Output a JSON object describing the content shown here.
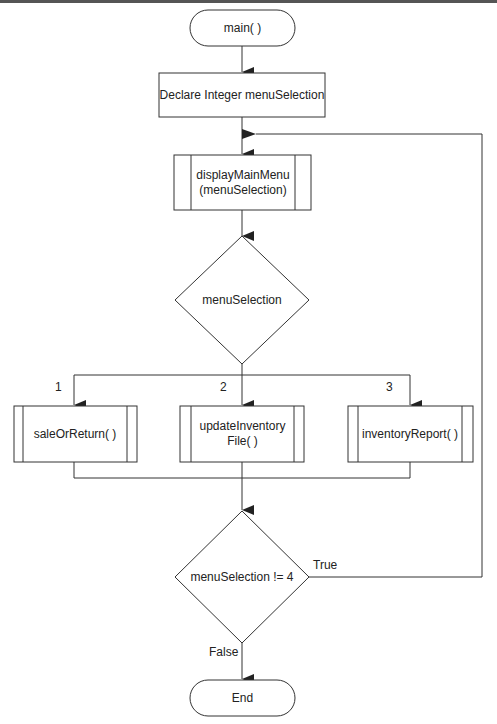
{
  "diagram": {
    "type": "flowchart",
    "nodes": {
      "start": {
        "shape": "terminal",
        "label": "main( )"
      },
      "declare": {
        "shape": "process",
        "label": "Declare Integer menuSelection"
      },
      "display_menu": {
        "shape": "predefined-process",
        "line1": "displayMainMenu",
        "line2": "(menuSelection)"
      },
      "switch": {
        "shape": "decision",
        "label": "menuSelection"
      },
      "sale": {
        "shape": "predefined-process",
        "label": "saleOrReturn( )"
      },
      "update": {
        "shape": "predefined-process",
        "line1": "updateInventory",
        "line2": "File( )"
      },
      "report": {
        "shape": "predefined-process",
        "label": "inventoryReport( )"
      },
      "loop_check": {
        "shape": "decision",
        "label": "menuSelection != 4"
      },
      "end": {
        "shape": "terminal",
        "label": "End"
      }
    },
    "edge_labels": {
      "case1": "1",
      "case2": "2",
      "case3": "3",
      "true": "True",
      "false": "False"
    },
    "edges": [
      {
        "from": "start",
        "to": "declare"
      },
      {
        "from": "declare",
        "to": "display_menu"
      },
      {
        "from": "display_menu",
        "to": "switch"
      },
      {
        "from": "switch",
        "to": "sale",
        "label": "1"
      },
      {
        "from": "switch",
        "to": "update",
        "label": "2"
      },
      {
        "from": "switch",
        "to": "report",
        "label": "3"
      },
      {
        "from": "sale",
        "to": "loop_check"
      },
      {
        "from": "update",
        "to": "loop_check"
      },
      {
        "from": "report",
        "to": "loop_check"
      },
      {
        "from": "loop_check",
        "to": "display_menu",
        "label": "True"
      },
      {
        "from": "loop_check",
        "to": "end",
        "label": "False"
      }
    ],
    "colors": {
      "stroke": "#333333",
      "text": "#222222",
      "background": "#ffffff"
    }
  }
}
